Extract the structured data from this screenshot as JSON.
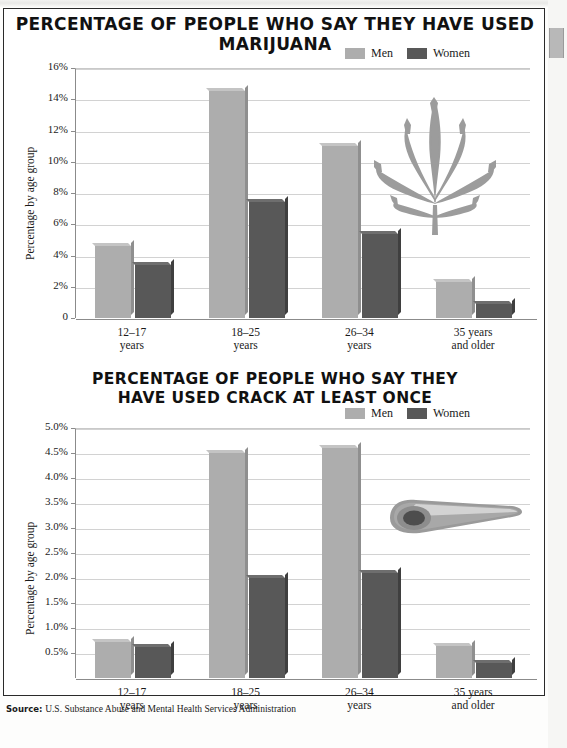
{
  "colors": {
    "men": "#ADADAD",
    "women": "#585858",
    "men_shade": "#8f8f8f",
    "women_shade": "#3f3f3f",
    "grid": "#d2d2d2",
    "axis": "#8b8b8b",
    "page": "#ffffff",
    "frame": "#2a2a2a"
  },
  "legend": {
    "men_label": "Men",
    "women_label": "Women"
  },
  "source": {
    "prefix": "Source:",
    "text": "U.S. Substance Abuse and Mental Health Services Administration"
  },
  "chart_data": [
    {
      "type": "bar",
      "id": "marijuana",
      "title": "PERCENTAGE OF PEOPLE WHO SAY THEY HAVE USED MARIJUANA",
      "title_lines": [
        "PERCENTAGE OF PEOPLE WHO SAY THEY HAVE USED MARIJUANA"
      ],
      "xlabel": "",
      "ylabel": "Percentage by age group",
      "ylim": [
        0,
        16
      ],
      "yticks": [
        0,
        2,
        4,
        6,
        8,
        10,
        12,
        14,
        16
      ],
      "ytick_labels": [
        "0",
        "2%",
        "4%",
        "6%",
        "8%",
        "10%",
        "12%",
        "14%",
        "16%"
      ],
      "grid": true,
      "legend_position": "top-right",
      "categories": [
        "12–17\nyears",
        "18–25\nyears",
        "26–34\nyears",
        "35 years\nand older"
      ],
      "category_lines": [
        [
          "12–17",
          "years"
        ],
        [
          "18–25",
          "years"
        ],
        [
          "26–34",
          "years"
        ],
        [
          "35 years",
          "and older"
        ]
      ],
      "series": [
        {
          "name": "Men",
          "values": [
            4.6,
            14.5,
            11.0,
            2.3
          ]
        },
        {
          "name": "Women",
          "values": [
            3.4,
            7.4,
            5.4,
            0.9
          ]
        }
      ],
      "decoration": "marijuana-leaf"
    },
    {
      "type": "bar",
      "id": "crack",
      "title": "PERCENTAGE OF PEOPLE WHO SAY THEY HAVE USED CRACK AT LEAST ONCE",
      "title_lines": [
        "PERCENTAGE OF PEOPLE WHO SAY THEY",
        "HAVE USED CRACK AT LEAST ONCE"
      ],
      "xlabel": "",
      "ylabel": "Percentage by age group",
      "ylim": [
        0,
        5.0
      ],
      "yticks": [
        0.5,
        1.0,
        1.5,
        2.0,
        2.5,
        3.0,
        3.5,
        4.0,
        4.5,
        5.0
      ],
      "ytick_labels": [
        "0.5%",
        "1.0%",
        "1.5%",
        "2.0%",
        "2.5%",
        "3.0%",
        "3.5%",
        "4.0%",
        "4.5%",
        "5.0%"
      ],
      "grid": true,
      "legend_position": "top-right",
      "categories": [
        "12–17\nyears",
        "18–25\nyears",
        "26–34\nyears",
        "35 years\nand older"
      ],
      "category_lines": [
        [
          "12–17",
          "years"
        ],
        [
          "18–25",
          "years"
        ],
        [
          "26–34",
          "years"
        ],
        [
          "35 years",
          "and older"
        ]
      ],
      "series": [
        {
          "name": "Men",
          "values": [
            0.72,
            4.5,
            4.6,
            0.65
          ]
        },
        {
          "name": "Women",
          "values": [
            0.62,
            2.0,
            2.1,
            0.3
          ]
        }
      ],
      "decoration": "crack-pipe"
    }
  ]
}
